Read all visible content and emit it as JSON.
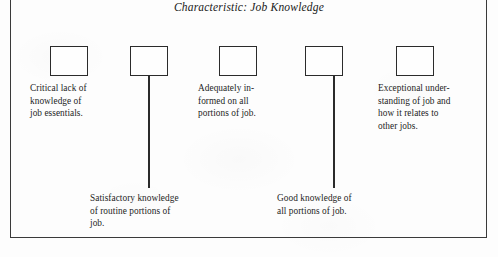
{
  "figure": {
    "title": "Characteristic: Job Knowledge",
    "scale_points": 5,
    "ink_color": "#2b2b2b",
    "paper_color": "#fdfdfd"
  },
  "boxes": [
    {
      "name": "rating-box-1",
      "position": 1,
      "x": 50,
      "y": 46
    },
    {
      "name": "rating-box-2",
      "position": 2,
      "x": 130,
      "y": 46
    },
    {
      "name": "rating-box-3",
      "position": 3,
      "x": 219,
      "y": 46
    },
    {
      "name": "rating-box-4",
      "position": 4,
      "x": 305,
      "y": 46
    },
    {
      "name": "rating-box-5",
      "position": 5,
      "x": 396,
      "y": 46
    }
  ],
  "captions": [
    {
      "id": "caption-1",
      "for_box": 1,
      "side": "above",
      "text": "Critical lack of\nknowledge of\njob essentials.",
      "x": 30,
      "y": 82,
      "width": 100
    },
    {
      "id": "caption-2",
      "for_box": 2,
      "side": "below",
      "text": "Satisfactory knowledge\nof routine portions of\njob.",
      "x": 90,
      "y": 192,
      "width": 140
    },
    {
      "id": "caption-3",
      "for_box": 3,
      "side": "above",
      "text": "Adequately in-\nformed on all\nportions of job.",
      "x": 198,
      "y": 82,
      "width": 105
    },
    {
      "id": "caption-4",
      "for_box": 4,
      "side": "below",
      "text": "Good knowledge of\nall portions of job.",
      "x": 277,
      "y": 192,
      "width": 130
    },
    {
      "id": "caption-5",
      "for_box": 5,
      "side": "above",
      "text": "Exceptional under-\nstanding of job and\nhow it relates to\nother jobs.",
      "x": 378,
      "y": 82,
      "width": 110
    }
  ],
  "leaders": [
    {
      "id": "leader-box-2",
      "from_box": 2,
      "x": 148,
      "top": 76,
      "height": 112
    },
    {
      "id": "leader-box-4",
      "from_box": 4,
      "x": 333,
      "top": 76,
      "height": 112
    }
  ]
}
